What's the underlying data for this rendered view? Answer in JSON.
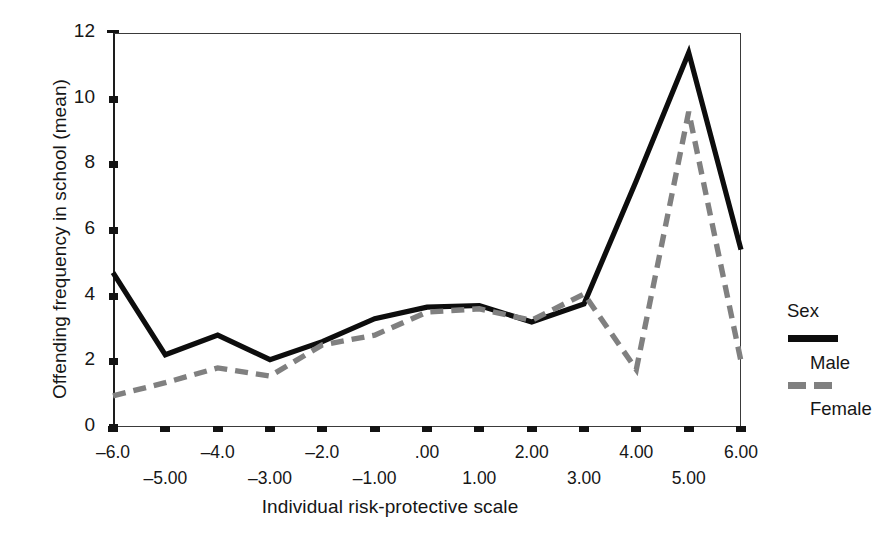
{
  "chart_data": {
    "type": "line",
    "title": "",
    "xlabel": "Individual risk-protective scale",
    "ylabel": "Offending frequency in school (mean)",
    "xlim": [
      -6,
      6
    ],
    "ylim": [
      0,
      12
    ],
    "grid": false,
    "legend_position": "right",
    "legend_title": "Sex",
    "x": [
      -6,
      -5,
      -4,
      -3,
      -2,
      -1,
      0,
      1,
      2,
      3,
      4,
      5,
      6
    ],
    "xtick_labels_row1": [
      "-6.0",
      "",
      "-4.0",
      "",
      "-2.0",
      "",
      ".00",
      "",
      "2.00",
      "",
      "4.00",
      "",
      "6.00"
    ],
    "xtick_labels_row2": [
      "",
      "-5.00",
      "",
      "-3.00",
      "",
      "-1.00",
      "",
      "1.00",
      "",
      "3.00",
      "",
      "5.00",
      ""
    ],
    "ytick_labels": [
      "0",
      "2",
      "4",
      "6",
      "8",
      "10",
      "12"
    ],
    "ytick_values": [
      0,
      2,
      4,
      6,
      8,
      10,
      12
    ],
    "series": [
      {
        "name": "Male",
        "style": "solid",
        "color": "#0d0d0d",
        "values": [
          4.7,
          2.2,
          2.8,
          2.05,
          2.6,
          3.3,
          3.65,
          3.7,
          3.2,
          3.75,
          7.5,
          11.4,
          5.4
        ]
      },
      {
        "name": "Female",
        "style": "dashed",
        "color": "#808080",
        "values": [
          0.95,
          1.35,
          1.8,
          1.55,
          2.5,
          2.8,
          3.5,
          3.6,
          3.25,
          4.05,
          1.75,
          9.6,
          2.0
        ]
      }
    ]
  },
  "legend": {
    "title": "Sex",
    "entries": [
      {
        "label": "Male",
        "style": "solid"
      },
      {
        "label": "Female",
        "style": "dashed"
      }
    ]
  }
}
